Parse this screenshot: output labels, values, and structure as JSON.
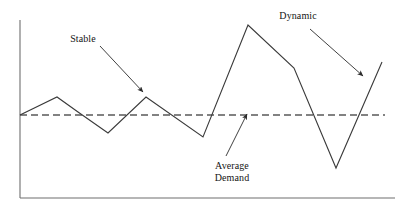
{
  "figure": {
    "background_color": "#ffffff",
    "line_color": "#3a3a3a",
    "axis_color": "#6e6e6e",
    "text_color": "#141414",
    "width": 405,
    "height": 210
  },
  "annotations": {
    "stable": {
      "label": "Stable",
      "x": 65,
      "y": 33
    },
    "dynamic": {
      "label": "Dynamic",
      "x": 272,
      "y": 10
    },
    "average_demand": {
      "line1": "Average",
      "line2": "Demand",
      "x": 232,
      "y": 160
    }
  },
  "series_names": {
    "demand": "Demand",
    "average": "Average Demand"
  },
  "chart_data": {
    "type": "line",
    "title": "",
    "xlabel": "",
    "ylabel": "",
    "grid": false,
    "legend": false,
    "axis": {
      "y_axis": {
        "x": 20,
        "y_top": 20,
        "y_bottom": 198
      },
      "x_axis": {
        "y": 198,
        "x_left": 20,
        "x_right": 395
      },
      "xlim": [
        20,
        395
      ],
      "ylim": [
        198,
        20
      ]
    },
    "series": [
      {
        "name": "Demand",
        "style": "solid",
        "color": "#3a3a3a",
        "points": [
          [
            20,
            115
          ],
          [
            57,
            97
          ],
          [
            78,
            112
          ],
          [
            108,
            133
          ],
          [
            146,
            97
          ],
          [
            203,
            137
          ],
          [
            248,
            25
          ],
          [
            294,
            68
          ],
          [
            336,
            168
          ],
          [
            382,
            62
          ]
        ]
      },
      {
        "name": "Average Demand",
        "style": "dashed",
        "color": "#5a5a5a",
        "points": [
          [
            20,
            115
          ],
          [
            385,
            115
          ]
        ]
      }
    ],
    "arrows": [
      {
        "name": "stable-arrow",
        "from": [
          100,
          46
        ],
        "to": [
          143,
          92
        ]
      },
      {
        "name": "average-demand-arrow",
        "from": [
          226,
          156
        ],
        "to": [
          247,
          114
        ]
      },
      {
        "name": "dynamic-arrow",
        "from": [
          310,
          29
        ],
        "to": [
          363,
          76
        ]
      }
    ],
    "regions": [
      {
        "name": "stable-region",
        "description": "Low amplitude oscillation around the average demand line, left half of the chart."
      },
      {
        "name": "dynamic-region",
        "description": "High amplitude oscillation far above and below the average demand line, right half of the chart."
      }
    ]
  }
}
